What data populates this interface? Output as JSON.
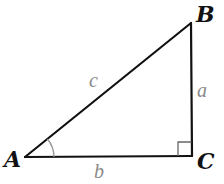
{
  "diagram": {
    "type": "right-triangle",
    "vertices": [
      {
        "id": "A",
        "label": "A",
        "x": 25,
        "y": 157
      },
      {
        "id": "B",
        "label": "B",
        "x": 191,
        "y": 23
      },
      {
        "id": "C",
        "label": "C",
        "x": 192,
        "y": 156
      }
    ],
    "sides": [
      {
        "id": "a",
        "label": "a",
        "from": "B",
        "to": "C"
      },
      {
        "id": "b",
        "label": "b",
        "from": "A",
        "to": "C"
      },
      {
        "id": "c",
        "label": "c",
        "from": "A",
        "to": "B"
      }
    ],
    "angle_marks": [
      {
        "at": "A",
        "type": "arc"
      },
      {
        "at": "C",
        "type": "right-angle-square"
      }
    ],
    "colors": {
      "lines": "#111111",
      "vertex_labels": "#111111",
      "side_labels": "#8a8a8a",
      "angle_arc": "#9a9a9a",
      "background": "#ffffff"
    }
  },
  "labels": {
    "A": "A",
    "B": "B",
    "C": "C",
    "a": "a",
    "b": "b",
    "c": "c"
  }
}
